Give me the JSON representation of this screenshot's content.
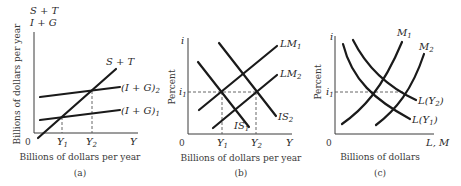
{
  "figure": {
    "panels": [
      {
        "id": "a",
        "caption": "(a)",
        "y_axis_top_label_1": "S + T",
        "y_axis_top_label_2": "I + G",
        "y_axis_title": "Billions of dollars per year",
        "x_axis_title": "Billions of dollars per year",
        "origin": "0",
        "x_ticks": [
          "Y",
          "Y"
        ],
        "x_tick_subs": [
          "1",
          "2"
        ],
        "x_end_label": "Y",
        "curve_labels": {
          "st": "S + T",
          "ig2_main": "(I + G)",
          "ig2_sub": "2",
          "ig1_main": "(I + G)",
          "ig1_sub": "1"
        }
      },
      {
        "id": "b",
        "caption": "(b)",
        "y_axis_label": "i",
        "y_axis_title": "Percent",
        "y_tick": "i",
        "y_tick_sub": "1",
        "x_axis_title": "Billions of dollars per year",
        "origin": "0",
        "x_ticks": [
          "Y",
          "Y"
        ],
        "x_tick_subs": [
          "1",
          "2"
        ],
        "x_end_label": "Y",
        "curve_labels": {
          "lm1_main": "LM",
          "lm1_sub": "1",
          "lm2_main": "LM",
          "lm2_sub": "2",
          "is1_main": "IS",
          "is1_sub": "1",
          "is2_main": "IS",
          "is2_sub": "2"
        }
      },
      {
        "id": "c",
        "caption": "(c)",
        "y_axis_label": "i",
        "y_axis_title": "Percent",
        "y_tick": "i",
        "y_tick_sub": "1",
        "x_axis_title": "Billions of dollars",
        "origin": "0",
        "x_end_label": "L, M",
        "curve_labels": {
          "m1_main": "M",
          "m1_sub": "1",
          "m2_main": "M",
          "m2_sub": "2",
          "ly2": "L(Y",
          "ly2_sub": "2",
          "ly2_close": ")",
          "ly1": "L(Y",
          "ly1_sub": "1",
          "ly1_close": ")"
        }
      }
    ]
  }
}
